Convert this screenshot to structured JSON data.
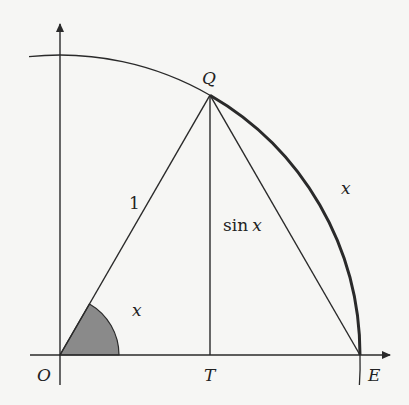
{
  "diagram": {
    "colors": {
      "stroke": "#2a2a2a",
      "sector_fill": "#8a8a8a",
      "background": "#f6f6f4"
    },
    "points": {
      "O": "O",
      "Q": "Q",
      "T": "T",
      "E": "E"
    },
    "labels": {
      "radius": "1",
      "height": "sin x",
      "height_fn": "sin",
      "height_var": "x",
      "angle": "x",
      "arc": "x"
    },
    "geometry": {
      "radius": 1,
      "angle_deg": 60
    }
  }
}
